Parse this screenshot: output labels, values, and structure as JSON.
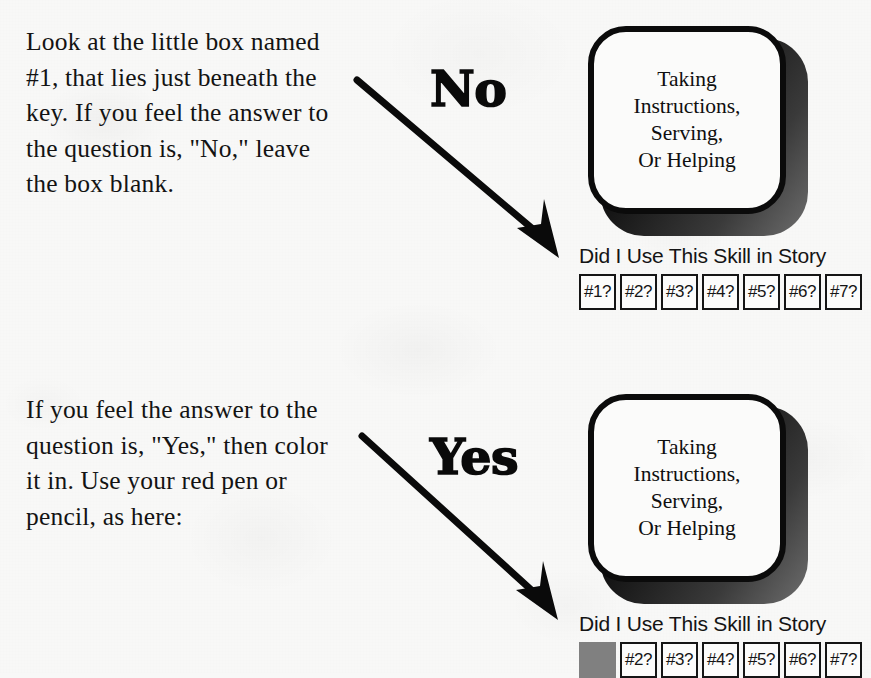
{
  "page": {
    "background_color": "#f8f8f7",
    "ink_color": "#131313"
  },
  "sections": [
    {
      "id": "no",
      "instruction": "Look at the little box named #1, that lies just beneath the key. If you feel the answer to the question is, \"No,\" leave the box blank.",
      "answer_word": "No",
      "arrow": "diagonal-down-right-arrow",
      "card": {
        "label": "Taking\nInstructions,\nServing,\nOr Helping",
        "caption": "Did I Use This Skill in Story",
        "cells": [
          {
            "label": "#1?",
            "filled": false
          },
          {
            "label": "#2?",
            "filled": false
          },
          {
            "label": "#3?",
            "filled": false
          },
          {
            "label": "#4?",
            "filled": false
          },
          {
            "label": "#5?",
            "filled": false
          },
          {
            "label": "#6?",
            "filled": false
          },
          {
            "label": "#7?",
            "filled": false
          }
        ]
      }
    },
    {
      "id": "yes",
      "instruction": "If you feel the answer to the question is, \"Yes,\" then color it in. Use your red pen or pencil, as here:",
      "answer_word": "Yes",
      "arrow": "diagonal-down-right-arrow",
      "card": {
        "label": "Taking\nInstructions,\nServing,\nOr Helping",
        "caption": "Did I Use This Skill in Story",
        "cells": [
          {
            "label": "#1?",
            "filled": true,
            "fill_color": "#808080"
          },
          {
            "label": "#2?",
            "filled": false
          },
          {
            "label": "#3?",
            "filled": false
          },
          {
            "label": "#4?",
            "filled": false
          },
          {
            "label": "#5?",
            "filled": false
          },
          {
            "label": "#6?",
            "filled": false
          },
          {
            "label": "#7?",
            "filled": false
          }
        ]
      }
    }
  ]
}
